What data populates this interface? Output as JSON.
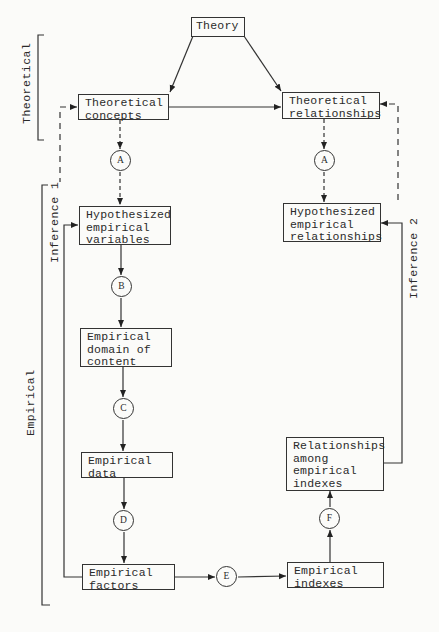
{
  "diagram": {
    "nodes": {
      "theory": "Theory",
      "theoretical_concepts": "Theoretical\nconcepts",
      "theoretical_relationships": "Theoretical\nrelationships",
      "hypothesized_empirical_variables": "Hypothesized\nempirical\nvariables",
      "hypothesized_empirical_relationships": "Hypothesized\nempirical\nrelationships",
      "empirical_domain_of_content": "Empirical\ndomain of\ncontent",
      "empirical_data": "Empirical\ndata",
      "empirical_factors": "Empirical\nfactors",
      "empirical_indexes": "Empirical\nindexes",
      "relationships_among_empirical_indexes": "Relationships\namong\nempirical\nindexes"
    },
    "steps": {
      "a_left": "A",
      "a_right": "A",
      "b": "B",
      "c": "C",
      "d": "D",
      "e": "E",
      "f": "F"
    },
    "side_labels": {
      "theoretical": "Theoretical",
      "empirical": "Empirical",
      "inference_1": "Inference 1",
      "inference_2": "Inference 2"
    },
    "edges": [
      {
        "from": "Theory",
        "to": "Theoretical concepts",
        "style": "solid"
      },
      {
        "from": "Theory",
        "to": "Theoretical relationships",
        "style": "solid"
      },
      {
        "from": "Theoretical concepts",
        "to": "Theoretical relationships",
        "style": "solid",
        "bidirectional": true
      },
      {
        "from": "Theoretical concepts",
        "to": "A",
        "style": "dashed"
      },
      {
        "from": "A",
        "to": "Hypothesized empirical variables",
        "style": "dashed"
      },
      {
        "from": "Theoretical relationships",
        "to": "A",
        "style": "dashed"
      },
      {
        "from": "A",
        "to": "Hypothesized empirical relationships",
        "style": "dashed"
      },
      {
        "from": "Hypothesized empirical variables",
        "to": "B",
        "style": "solid"
      },
      {
        "from": "B",
        "to": "Empirical domain of content",
        "style": "solid"
      },
      {
        "from": "Empirical domain of content",
        "to": "C",
        "style": "solid"
      },
      {
        "from": "C",
        "to": "Empirical data",
        "style": "solid"
      },
      {
        "from": "Empirical data",
        "to": "D",
        "style": "solid"
      },
      {
        "from": "D",
        "to": "Empirical factors",
        "style": "solid"
      },
      {
        "from": "Empirical factors",
        "to": "E",
        "style": "solid"
      },
      {
        "from": "E",
        "to": "Empirical indexes",
        "style": "solid"
      },
      {
        "from": "Empirical indexes",
        "to": "F",
        "style": "solid"
      },
      {
        "from": "F",
        "to": "Relationships among empirical indexes",
        "style": "solid"
      },
      {
        "from": "Empirical factors",
        "to": "Hypothesized empirical variables",
        "style": "solid"
      },
      {
        "from": "Relationships among empirical indexes",
        "to": "Hypothesized empirical relationships",
        "style": "solid"
      },
      {
        "from": "Hypothesized empirical variables",
        "to": "Theoretical concepts",
        "style": "dashed",
        "label": "Inference 1"
      },
      {
        "from": "Hypothesized empirical relationships",
        "to": "Theoretical relationships",
        "style": "dashed",
        "label": "Inference 2"
      }
    ]
  }
}
